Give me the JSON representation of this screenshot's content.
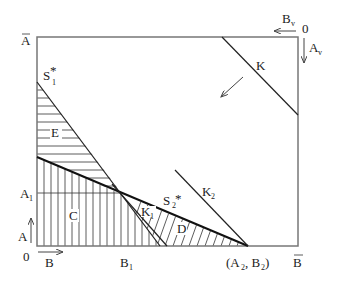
{
  "diagram": {
    "type": "edgeworth-box",
    "labels": {
      "a_bar": "A",
      "b_bar": "B",
      "origin_bottom": "0",
      "origin_top": "0",
      "axis_a": "A",
      "axis_b": "B",
      "axis_av": "A",
      "axis_av_sub": "v",
      "axis_bv": "B",
      "axis_bv_sub": "v",
      "a1": "A",
      "a1_sub": "1",
      "b1": "B",
      "b1_sub": "1",
      "a2b2": "(A",
      "a2b2_sub1": "2",
      "a2b2_mid": ", B",
      "a2b2_sub2": "2",
      "a2b2_end": ")",
      "s1": "S",
      "s1_sub": "1",
      "s1_star": "*",
      "s2": "S",
      "s2_sub": "2",
      "s2_star": "*",
      "k": "K",
      "k1": "K",
      "k1_sub": "1",
      "k2": "K",
      "k2_sub": "2",
      "region_c": "C",
      "region_d": "D",
      "region_e": "E"
    },
    "colors": {
      "box": "#777777",
      "lines": "#222222",
      "background": "#ffffff"
    }
  }
}
